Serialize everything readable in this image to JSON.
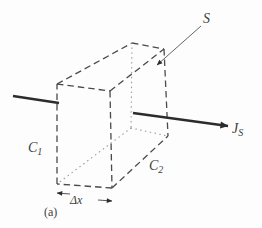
{
  "figure": {
    "width": 262,
    "height": 228,
    "colors": {
      "background": "#fdfdfd",
      "dashed": "#4a4a4a",
      "dotted": "#979797",
      "thick": "#2c2c2c",
      "thin": "#565656",
      "text": "#3d3d3d",
      "arrowhead": "#2c2c2c"
    },
    "vertices": {
      "ftl": [
        57,
        84
      ],
      "ftr": [
        110,
        91
      ],
      "fbr": [
        112,
        188
      ],
      "fbl": [
        57,
        184
      ],
      "btl": [
        132,
        43
      ],
      "btr": [
        164,
        49
      ],
      "bbr": [
        168,
        136
      ],
      "bbl": [
        131,
        128
      ]
    },
    "edges": [
      {
        "name": "front-top",
        "from": "ftl",
        "to": "ftr",
        "style": "dashed"
      },
      {
        "name": "front-right",
        "from": "ftr",
        "to": "fbr",
        "style": "dashed"
      },
      {
        "name": "front-bottom",
        "from": "fbr",
        "to": "fbl",
        "style": "dashed"
      },
      {
        "name": "front-left",
        "from": "fbl",
        "to": "ftl",
        "style": "dashed"
      },
      {
        "name": "top-left",
        "from": "ftl",
        "to": "btl",
        "style": "dashed"
      },
      {
        "name": "top-back",
        "from": "btl",
        "to": "btr",
        "style": "dashed"
      },
      {
        "name": "top-right",
        "from": "ftr",
        "to": "btr",
        "style": "dashed"
      },
      {
        "name": "back-right",
        "from": "btr",
        "to": "bbr",
        "style": "dashed"
      },
      {
        "name": "bottom-right",
        "from": "fbr",
        "to": "bbr",
        "style": "dashed"
      },
      {
        "name": "hidden-back-left",
        "from": "btl",
        "to": "bbl",
        "style": "dotted"
      },
      {
        "name": "hidden-bottom-left",
        "from": "bbl",
        "to": "fbl",
        "style": "dotted"
      },
      {
        "name": "hidden-bottom-back",
        "from": "bbl",
        "to": "bbr",
        "style": "dotted"
      }
    ],
    "arrows": [
      {
        "name": "influx-line",
        "x1": 13,
        "y1": 96,
        "x2": 59,
        "y2": 103,
        "width": 2.4,
        "head": false,
        "color": "thick"
      },
      {
        "name": "outflux-arrow",
        "x1": 133,
        "y1": 113,
        "x2": 228,
        "y2": 126,
        "width": 2.4,
        "head": "big",
        "color": "thick"
      },
      {
        "name": "surface-leader-arrow",
        "x1": 201,
        "y1": 26,
        "x2": 157,
        "y2": 65,
        "width": 0.9,
        "head": "small",
        "color": "thin"
      },
      {
        "name": "dx-left-arrow",
        "x1": 70,
        "y1": 194,
        "x2": 57,
        "y2": 193,
        "width": 1,
        "head": "small",
        "color": "thin"
      },
      {
        "name": "dx-right-arrow",
        "x1": 98,
        "y1": 200,
        "x2": 112,
        "y2": 201,
        "width": 1,
        "head": "small",
        "color": "thin"
      }
    ],
    "labels": [
      {
        "name": "label-surface",
        "text": "S",
        "sub": "",
        "x": 203,
        "y": 23,
        "size": 14,
        "italic": true
      },
      {
        "name": "label-flux",
        "text": "J",
        "sub": "S",
        "x": 232,
        "y": 133,
        "size": 14,
        "italic": true
      },
      {
        "name": "label-concentration-1",
        "text": "C",
        "sub": "1",
        "x": 28,
        "y": 152,
        "size": 14,
        "italic": true
      },
      {
        "name": "label-concentration-2",
        "text": "C",
        "sub": "2",
        "x": 149,
        "y": 170,
        "size": 14,
        "italic": true
      },
      {
        "name": "label-delta-x",
        "text": "Δx",
        "sub": "",
        "x": 70,
        "y": 204,
        "size": 12,
        "italic": true
      },
      {
        "name": "label-panel-a",
        "text": "(a)",
        "sub": "",
        "x": 44,
        "y": 216,
        "size": 12,
        "italic": false
      }
    ]
  }
}
